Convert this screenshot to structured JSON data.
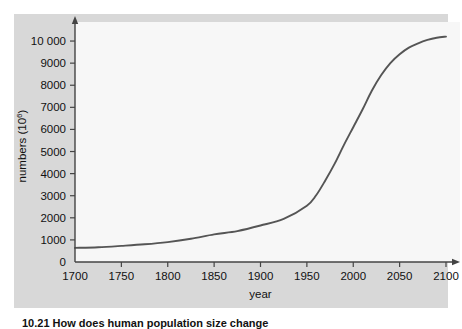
{
  "figure": {
    "panel_background": "#d8d8d8",
    "plot_background": "#f7f7f7",
    "caption": "10.21  How does human population size change"
  },
  "chart_data": {
    "type": "line",
    "title": "",
    "xlabel": "year",
    "ylabel": "numbers (10",
    "ylabel_exponent": "6",
    "ylabel_suffix": ")",
    "xlim": [
      1700,
      2100
    ],
    "ylim": [
      0,
      10500
    ],
    "xticks": [
      1700,
      1750,
      1800,
      1850,
      1900,
      1950,
      2000,
      2050,
      2100
    ],
    "xtick_labels": [
      "1700",
      "1750",
      "1800",
      "1850",
      "1900",
      "1950",
      "2000",
      "2050",
      "2100"
    ],
    "yticks": [
      0,
      1000,
      2000,
      3000,
      4000,
      5000,
      6000,
      7000,
      8000,
      9000,
      10000
    ],
    "ytick_labels": [
      "0",
      "1000",
      "2000",
      "3000",
      "4000",
      "5000",
      "6000",
      "7000",
      "8000",
      "9000",
      "10 000"
    ],
    "grid": false,
    "legend": false,
    "line_color": "#555555",
    "axis_color": "#444444",
    "series": [
      {
        "name": "human population",
        "x": [
          1700,
          1725,
          1750,
          1775,
          1800,
          1825,
          1850,
          1875,
          1900,
          1925,
          1950,
          1960,
          1970,
          1980,
          1990,
          2000,
          2010,
          2020,
          2030,
          2040,
          2050,
          2060,
          2070,
          2080,
          2090,
          2100
        ],
        "values": [
          640,
          670,
          730,
          800,
          900,
          1050,
          1250,
          1400,
          1650,
          1950,
          2550,
          3020,
          3700,
          4450,
          5300,
          6100,
          6900,
          7750,
          8450,
          9000,
          9400,
          9700,
          9900,
          10050,
          10150,
          10200
        ]
      }
    ]
  }
}
